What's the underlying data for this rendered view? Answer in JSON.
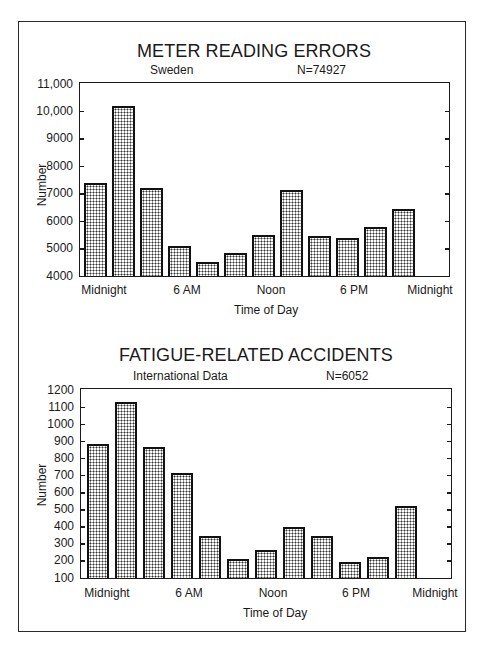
{
  "chart_data": [
    {
      "type": "bar",
      "title": "METER READING ERRORS",
      "subtitle_left": "Sweden",
      "subtitle_right": "N=74927",
      "xlabel": "Time of Day",
      "ylabel": "Number",
      "ylim": [
        4000,
        11000
      ],
      "yticks": [
        "4000",
        "5000",
        "6000",
        "7000",
        "8000",
        "9000",
        "10,000",
        "11,000"
      ],
      "xtick_labels": [
        "Midnight",
        "6 AM",
        "Noon",
        "6 PM",
        "Midnight"
      ],
      "categories": [
        "0-2",
        "2-4",
        "4-6",
        "6-8",
        "8-10",
        "10-12",
        "12-14",
        "14-16",
        "16-18",
        "18-20",
        "20-22",
        "22-24"
      ],
      "values": [
        7400,
        10200,
        7200,
        5100,
        4500,
        4850,
        5500,
        7150,
        5450,
        5400,
        5800,
        6450
      ],
      "grid": false,
      "legend": "none"
    },
    {
      "type": "bar",
      "title": "FATIGUE-RELATED ACCIDENTS",
      "subtitle_left": "International Data",
      "subtitle_right": "N=6052",
      "xlabel": "Time of Day",
      "ylabel": "Number",
      "ylim": [
        100,
        1200
      ],
      "yticks": [
        "100",
        "200",
        "300",
        "400",
        "500",
        "600",
        "700",
        "800",
        "900",
        "1000",
        "1100",
        "1200"
      ],
      "xtick_labels": [
        "Midnight",
        "6 AM",
        "Noon",
        "6 PM",
        "Midnight"
      ],
      "categories": [
        "0-2",
        "2-4",
        "4-6",
        "6-8",
        "8-10",
        "10-12",
        "12-14",
        "14-16",
        "16-18",
        "18-20",
        "20-22",
        "22-24"
      ],
      "values": [
        885,
        1130,
        865,
        715,
        345,
        210,
        265,
        400,
        345,
        195,
        225,
        520
      ],
      "grid": false,
      "legend": "none"
    }
  ],
  "charts": [
    {
      "title": "METER READING ERRORS",
      "subtitle_left": "Sweden",
      "subtitle_right": "N=74927",
      "xlabel": "Time of Day",
      "ylabel": "Number"
    },
    {
      "title": "FATIGUE-RELATED ACCIDENTS",
      "subtitle_left": "International Data",
      "subtitle_right": "N=6052",
      "xlabel": "Time of Day",
      "ylabel": "Number"
    }
  ],
  "colors": {
    "bar_border": "#111111",
    "bar_fill_dot": "#333333",
    "background": "#ffffff"
  }
}
